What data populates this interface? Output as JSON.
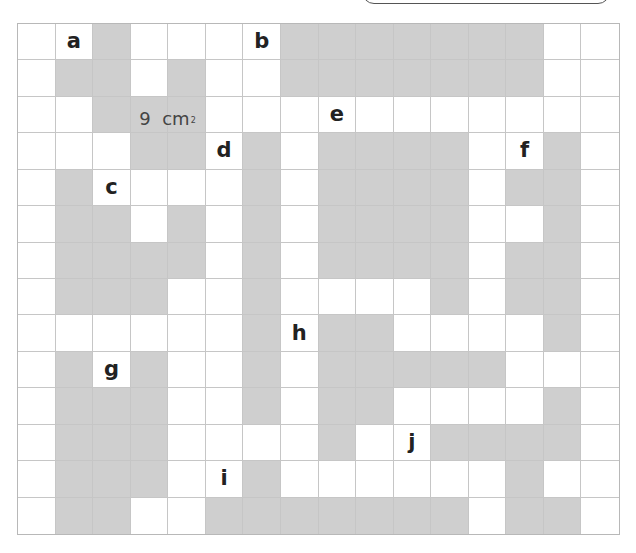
{
  "grid": {
    "columns": 16,
    "rows": 14,
    "shaded_color": "#cfcfcf",
    "empty_color": "#ffffff",
    "line_color": "#c6c6c6",
    "cells": [
      [
        0,
        0,
        1,
        0,
        0,
        0,
        0,
        1,
        1,
        1,
        1,
        1,
        1,
        1,
        0,
        0
      ],
      [
        0,
        1,
        1,
        0,
        1,
        0,
        0,
        1,
        1,
        1,
        1,
        1,
        1,
        1,
        0,
        0
      ],
      [
        0,
        0,
        1,
        1,
        1,
        0,
        0,
        0,
        0,
        0,
        0,
        0,
        0,
        0,
        0,
        0
      ],
      [
        0,
        0,
        0,
        1,
        1,
        0,
        1,
        0,
        1,
        1,
        1,
        1,
        0,
        0,
        1,
        0
      ],
      [
        0,
        1,
        0,
        0,
        0,
        0,
        1,
        0,
        1,
        1,
        1,
        1,
        0,
        1,
        1,
        0
      ],
      [
        0,
        1,
        1,
        0,
        1,
        0,
        1,
        0,
        1,
        1,
        1,
        1,
        0,
        0,
        1,
        0
      ],
      [
        0,
        1,
        1,
        1,
        1,
        0,
        1,
        0,
        1,
        1,
        1,
        1,
        0,
        1,
        1,
        0
      ],
      [
        0,
        1,
        1,
        1,
        0,
        0,
        1,
        0,
        0,
        0,
        0,
        1,
        0,
        1,
        1,
        0
      ],
      [
        0,
        0,
        0,
        0,
        0,
        0,
        1,
        0,
        1,
        1,
        0,
        0,
        0,
        0,
        1,
        0
      ],
      [
        0,
        1,
        0,
        1,
        0,
        0,
        1,
        0,
        1,
        1,
        1,
        1,
        1,
        0,
        0,
        0
      ],
      [
        0,
        1,
        1,
        1,
        0,
        0,
        1,
        0,
        1,
        1,
        0,
        0,
        0,
        0,
        1,
        0
      ],
      [
        0,
        1,
        1,
        1,
        0,
        0,
        0,
        0,
        1,
        0,
        0,
        1,
        1,
        1,
        1,
        0
      ],
      [
        0,
        1,
        1,
        1,
        0,
        0,
        1,
        0,
        0,
        0,
        0,
        0,
        0,
        1,
        0,
        0
      ],
      [
        0,
        1,
        1,
        0,
        0,
        1,
        1,
        1,
        1,
        1,
        1,
        1,
        0,
        1,
        1,
        0
      ]
    ],
    "labels": [
      {
        "text": "a",
        "row": 0,
        "col": 1
      },
      {
        "text": "b",
        "row": 0,
        "col": 6
      },
      {
        "text": "e",
        "row": 2,
        "col": 8
      },
      {
        "text": "d",
        "row": 3,
        "col": 5
      },
      {
        "text": "f",
        "row": 3,
        "col": 13
      },
      {
        "text": "c",
        "row": 4,
        "col": 2
      },
      {
        "text": "h",
        "row": 8,
        "col": 7
      },
      {
        "text": "g",
        "row": 9,
        "col": 2
      },
      {
        "text": "j",
        "row": 11,
        "col": 10
      },
      {
        "text": "i",
        "row": 12,
        "col": 5
      }
    ]
  },
  "area_label": {
    "value": "9",
    "unit": "cm",
    "exponent": "2"
  }
}
